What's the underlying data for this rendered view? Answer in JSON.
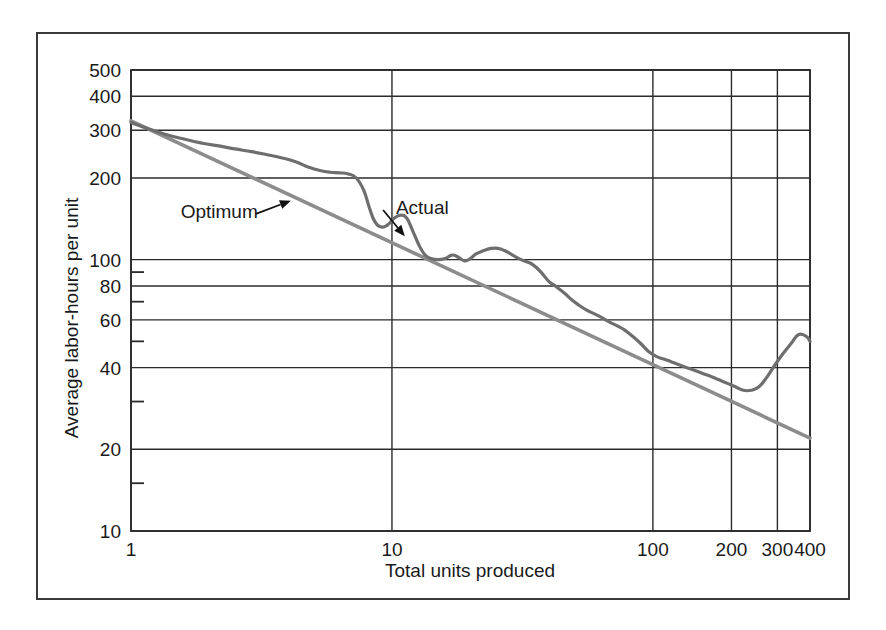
{
  "figure": {
    "background_color": "#ffffff",
    "frame_color": "#3a3a3a"
  },
  "chart_data": {
    "type": "line",
    "title": "",
    "subtitle": "",
    "xlabel": "Total units produced",
    "ylabel": "Average labor-hours per unit",
    "xscale": "log",
    "yscale": "log",
    "xlim": [
      1,
      400
    ],
    "ylim": [
      10,
      500
    ],
    "grid": true,
    "legend_position": "inline-annotations",
    "xticks": [
      1,
      10,
      100,
      200,
      300,
      400
    ],
    "xtick_labels": [
      "1",
      "10",
      "100",
      "200",
      "300",
      "400"
    ],
    "yticks": [
      10,
      20,
      40,
      60,
      80,
      100,
      200,
      300,
      400,
      500
    ],
    "ytick_labels": [
      "10",
      "20",
      "40",
      "60",
      "80",
      "100",
      "200",
      "300",
      "400",
      "500"
    ],
    "y_minor_ticks": [
      15,
      30,
      50,
      70,
      90
    ],
    "colors": {
      "optimum": "#8c8c8c",
      "actual": "#6e6e6e",
      "grid": "#2b2b2b",
      "text": "#1a1a1a"
    },
    "annotations": [
      {
        "text": "Optimum",
        "label_x": 1.55,
        "label_y": 150,
        "target_x": 4.1,
        "target_y": 165,
        "series": "optimum"
      },
      {
        "text": "Actual",
        "label_x": 16.5,
        "label_y": 155,
        "target_x": 11.2,
        "target_y": 122,
        "series": "actual"
      }
    ],
    "series": [
      {
        "name": "Optimum",
        "color": "#8c8c8c",
        "description": "Straight learning curve on log-log axes",
        "x": [
          1,
          400
        ],
        "values": [
          325,
          22
        ]
      },
      {
        "name": "Actual",
        "color": "#6e6e6e",
        "description": "Observed average labor-hours per unit",
        "x": [
          1,
          1.15,
          1.35,
          1.6,
          1.9,
          2.2,
          2.5,
          2.9,
          3.3,
          3.8,
          4.3,
          4.8,
          5.3,
          5.8,
          6.3,
          6.8,
          7.3,
          7.8,
          8.2,
          8.6,
          9.1,
          9.6,
          10.2,
          10.8,
          11.4,
          12.0,
          12.7,
          13.4,
          14.1,
          15.0,
          16.0,
          17.0,
          18.0,
          19.0,
          20.0,
          21.0,
          22.5,
          24.0,
          25.5,
          27.0,
          28.5,
          30.0,
          32.0,
          34.0,
          36.0,
          38.0,
          40.0,
          43.0,
          46.0,
          49.0,
          52.0,
          56.0,
          60.0,
          64.0,
          68.0,
          73.0,
          78.0,
          84.0,
          90.0,
          96.0,
          103.0,
          110.0,
          118.0,
          126.0,
          135.0,
          145.0,
          156.0,
          168.0,
          180.0,
          193.0,
          207.0,
          222.0,
          238.0,
          255.0,
          274.0,
          294.0,
          315.0,
          338.0,
          362.0,
          388.0,
          400.0
        ],
        "values": [
          320,
          305,
          290,
          278,
          268,
          262,
          256,
          250,
          244,
          237,
          229,
          219,
          213,
          210,
          209,
          207,
          200,
          180,
          155,
          138,
          132,
          134,
          142,
          146,
          142,
          128,
          113,
          104,
          101,
          100,
          101,
          104,
          102,
          99,
          101,
          105,
          108,
          110,
          110,
          108,
          105,
          102,
          99,
          97,
          93,
          88,
          83,
          79,
          75,
          71,
          68,
          65,
          63,
          61,
          59,
          57,
          55,
          52,
          49,
          46,
          44,
          43,
          42,
          41,
          40,
          39,
          38,
          37,
          36,
          35,
          34,
          33,
          33,
          34,
          37,
          41,
          45,
          49,
          53,
          52,
          50
        ]
      }
    ]
  },
  "axes": {
    "x_label_text": "Total units produced",
    "y_label_text": "Average labor-hours per unit"
  }
}
